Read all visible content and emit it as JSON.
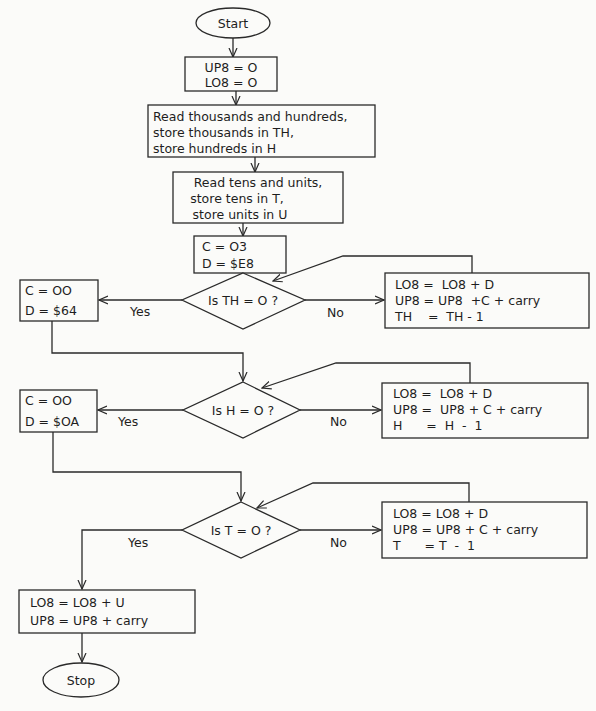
{
  "diagram": {
    "type": "flowchart",
    "nodes": {
      "start": {
        "shape": "terminal",
        "label": "Start"
      },
      "init": {
        "shape": "process",
        "lines": [
          "UP8 = O",
          "LO8 = O"
        ]
      },
      "read_th_h": {
        "shape": "process",
        "lines": [
          "Read thousands and hundreds,",
          "store thousands in TH,",
          "store hundreds in H"
        ]
      },
      "read_t_u": {
        "shape": "process",
        "lines": [
          "Read tens and units,",
          "store tens in T,",
          "store units in U"
        ]
      },
      "set_cd_1": {
        "shape": "process",
        "lines": [
          "C = O3",
          "D = $E8"
        ]
      },
      "dec_th": {
        "shape": "decision",
        "label": "Is TH = O ?"
      },
      "set_cd_2": {
        "shape": "process",
        "lines": [
          "C = OO",
          "D = $64"
        ]
      },
      "loop_th": {
        "shape": "process",
        "lines": [
          "LO8 =  LO8 + D",
          "UP8 = UP8  +C + carry",
          "TH    =  TH - 1"
        ]
      },
      "dec_h": {
        "shape": "decision",
        "label": "Is H = O ?"
      },
      "set_cd_3": {
        "shape": "process",
        "lines": [
          "C = OO",
          "D = $OA"
        ]
      },
      "loop_h": {
        "shape": "process",
        "lines": [
          "LO8 =  LO8 + D",
          "UP8 =  UP8 + C + carry",
          "H      =  H  -  1"
        ]
      },
      "dec_t": {
        "shape": "decision",
        "label": "Is T = O ?"
      },
      "loop_t": {
        "shape": "process",
        "lines": [
          "LO8 = LO8 + D",
          "UP8 = UP8 + C + carry",
          "T      = T  -  1"
        ]
      },
      "final": {
        "shape": "process",
        "lines": [
          "LO8 = LO8 + U",
          "UP8 = UP8 + carry"
        ]
      },
      "stop": {
        "shape": "terminal",
        "label": "Stop"
      }
    },
    "edges": [
      {
        "from": "start",
        "to": "init"
      },
      {
        "from": "init",
        "to": "read_th_h"
      },
      {
        "from": "read_th_h",
        "to": "read_t_u"
      },
      {
        "from": "read_t_u",
        "to": "set_cd_1"
      },
      {
        "from": "set_cd_1",
        "to": "dec_th"
      },
      {
        "from": "dec_th",
        "to": "set_cd_2",
        "label": "Yes"
      },
      {
        "from": "dec_th",
        "to": "loop_th",
        "label": "No"
      },
      {
        "from": "loop_th",
        "to": "dec_th"
      },
      {
        "from": "set_cd_2",
        "to": "dec_h"
      },
      {
        "from": "dec_h",
        "to": "set_cd_3",
        "label": "Yes"
      },
      {
        "from": "dec_h",
        "to": "loop_h",
        "label": "No"
      },
      {
        "from": "loop_h",
        "to": "dec_h"
      },
      {
        "from": "set_cd_3",
        "to": "dec_t"
      },
      {
        "from": "dec_t",
        "to": "final",
        "label": "Yes"
      },
      {
        "from": "dec_t",
        "to": "loop_t",
        "label": "No"
      },
      {
        "from": "loop_t",
        "to": "dec_t"
      },
      {
        "from": "final",
        "to": "stop"
      }
    ],
    "edge_labels": {
      "yes": "Yes",
      "no": "No"
    },
    "colors": {
      "ink": "#2a2a2a",
      "paper": "#fbfbf9"
    }
  }
}
